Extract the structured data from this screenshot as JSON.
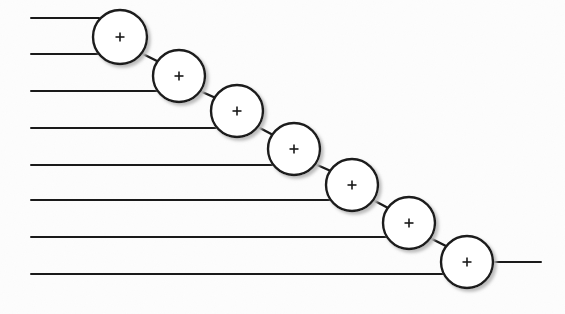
{
  "figure": {
    "background_color": "#fdfdfd",
    "ink_color": "#1a1a1a",
    "shadow_color": "#b9b9b9",
    "width": 565,
    "height": 314
  },
  "style": {
    "line_width": 2.0,
    "circle_stroke_width": 2.4,
    "circle_fill": "#ffffff",
    "plus_stroke_width": 1.6,
    "plus_arm_length": 9
  },
  "nodes": [
    {
      "id": "adder-1",
      "label": "+",
      "cx": 120,
      "cy": 37,
      "r": 27
    },
    {
      "id": "adder-2",
      "label": "+",
      "cx": 179,
      "cy": 76,
      "r": 26
    },
    {
      "id": "adder-3",
      "label": "+",
      "cx": 237,
      "cy": 111,
      "r": 26
    },
    {
      "id": "adder-4",
      "label": "+",
      "cx": 294,
      "cy": 149,
      "r": 26
    },
    {
      "id": "adder-5",
      "label": "+",
      "cx": 352,
      "cy": 185,
      "r": 26
    },
    {
      "id": "adder-6",
      "label": "+",
      "cx": 409,
      "cy": 223,
      "r": 26
    },
    {
      "id": "adder-7",
      "label": "+",
      "cx": 467,
      "cy": 262,
      "r": 26
    }
  ],
  "input_lines": [
    {
      "id": "input-1",
      "x1": 31,
      "y1": 18,
      "x2": 99,
      "y2": 18
    },
    {
      "id": "input-2",
      "x1": 31,
      "y1": 54,
      "x2": 99,
      "y2": 54
    },
    {
      "id": "input-3",
      "x1": 31,
      "y1": 91,
      "x2": 158,
      "y2": 91
    },
    {
      "id": "input-4",
      "x1": 31,
      "y1": 128,
      "x2": 216,
      "y2": 128
    },
    {
      "id": "input-5",
      "x1": 31,
      "y1": 165,
      "x2": 274,
      "y2": 165
    },
    {
      "id": "input-6",
      "x1": 31,
      "y1": 200,
      "x2": 331,
      "y2": 200
    },
    {
      "id": "input-7",
      "x1": 31,
      "y1": 237,
      "x2": 389,
      "y2": 237
    },
    {
      "id": "input-8",
      "x1": 31,
      "y1": 274,
      "x2": 447,
      "y2": 274
    }
  ],
  "connectors": [
    {
      "id": "link-1-2",
      "x1": 141,
      "y1": 53,
      "x2": 161,
      "y2": 63
    },
    {
      "id": "link-2-3",
      "x1": 200,
      "y1": 91,
      "x2": 218,
      "y2": 99
    },
    {
      "id": "link-3-4",
      "x1": 258,
      "y1": 127,
      "x2": 275,
      "y2": 136
    },
    {
      "id": "link-4-5",
      "x1": 315,
      "y1": 164,
      "x2": 333,
      "y2": 172
    },
    {
      "id": "link-5-6",
      "x1": 373,
      "y1": 200,
      "x2": 390,
      "y2": 209
    },
    {
      "id": "link-6-7",
      "x1": 430,
      "y1": 238,
      "x2": 448,
      "y2": 247
    }
  ],
  "output_line": {
    "id": "output-1",
    "x1": 493,
    "y1": 262,
    "x2": 541,
    "y2": 262
  }
}
